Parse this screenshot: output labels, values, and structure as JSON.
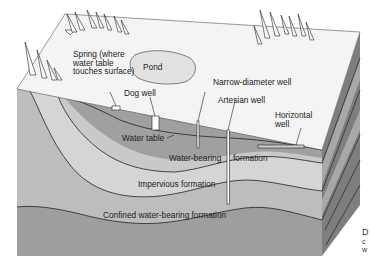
{
  "diagram": {
    "colors": {
      "surface": "#f4f4f4",
      "water_bearing": "#9a9a9a",
      "upper_layer": "#c6c6c6",
      "impervious": "#d3d3d3",
      "confined": "#bdbdbd",
      "deep_layer": "#9e9e9e",
      "side_face": "#7e7e7e",
      "side_light": "#a8a8a8",
      "pond": "#e2e2e2",
      "line": "#222222"
    },
    "labels": {
      "spring": "Spring (where water table touches surface)",
      "pond": "Pond",
      "dog_well": "Dog well",
      "narrow_well": "Narrow-diameter well",
      "artesian_well": "Artesian well",
      "horizontal_well": "Horizontal well",
      "water_table": "Water table",
      "water_bearing": "Water-bearing",
      "formation": "formation",
      "impervious": "Impervious formation",
      "confined": "Confined water-bearing formation"
    },
    "caption_fragment": {
      "line1": "D",
      "line2": "c",
      "line3": "w"
    }
  }
}
